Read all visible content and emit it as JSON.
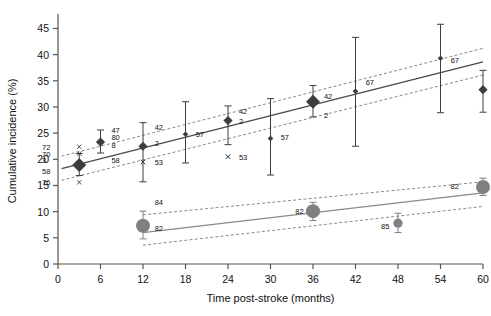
{
  "chart_data": {
    "type": "scatter",
    "title": "",
    "xlabel": "Time post-stroke (months)",
    "ylabel": "Cumulative incidence (%)",
    "xlim": [
      0,
      60
    ],
    "ylim": [
      0,
      47
    ],
    "xticks": [
      0,
      6,
      12,
      18,
      24,
      30,
      36,
      42,
      48,
      54,
      60
    ],
    "xtick_labels": [
      "0",
      "6",
      "12",
      "18",
      "24",
      "30",
      "36",
      "42",
      "48",
      "54",
      "60"
    ],
    "yticks": [
      0,
      5,
      10,
      15,
      20,
      25,
      30,
      35,
      40,
      45
    ],
    "ytick_labels": [
      "0",
      "5",
      "10",
      "15",
      "20",
      "25",
      "30",
      "35",
      "40",
      "45"
    ],
    "grid": false,
    "legend": "none",
    "colors": {
      "upper_marker": "#3d3d3d",
      "lower_marker": "#808080",
      "upper_line": "#4a4a4a",
      "lower_line": "#8a8a8a",
      "ci_band": "#8a8a8a",
      "axis": "#555555"
    },
    "series": [
      {
        "name": "upper-series",
        "marker": "diamond",
        "fit_line": {
          "x": [
            0.5,
            60
          ],
          "y": [
            18.2,
            38.6
          ]
        },
        "ci_upper": {
          "x": [
            0.5,
            60
          ],
          "y": [
            20.6,
            41.2
          ]
        },
        "ci_lower": {
          "x": [
            0.5,
            60
          ],
          "y": [
            16.0,
            36.1
          ]
        },
        "points": [
          {
            "x": 3,
            "y": 18.9,
            "lo": 16.9,
            "hi": 21.1,
            "size": "large",
            "labels": [
              "72",
              "70",
              "3",
              "58",
              "76"
            ]
          },
          {
            "x": 6,
            "y": 23.3,
            "lo": 21.2,
            "hi": 25.6,
            "size": "medium",
            "labels": [
              "47",
              "80",
              "8",
              "58"
            ]
          },
          {
            "x": 12,
            "y": 22.5,
            "lo": 15.7,
            "hi": 27.0,
            "size": "medium",
            "labels": [
              "42",
              "2",
              "53"
            ]
          },
          {
            "x": 18,
            "y": 24.8,
            "lo": 19.3,
            "hi": 31.0,
            "size": "small",
            "labels": [
              "57"
            ]
          },
          {
            "x": 24,
            "y": 27.4,
            "lo": 22.8,
            "hi": 30.2,
            "size": "medium",
            "labels": [
              "42",
              "2",
              "53"
            ]
          },
          {
            "x": 30,
            "y": 24.0,
            "lo": 17.0,
            "hi": 31.6,
            "size": "small",
            "labels": [
              "57"
            ]
          },
          {
            "x": 36,
            "y": 31.0,
            "lo": 28.1,
            "hi": 34.1,
            "size": "large",
            "labels": [
              "42",
              "2"
            ]
          },
          {
            "x": 42,
            "y": 33.0,
            "lo": 22.5,
            "hi": 43.3,
            "size": "small",
            "labels": [
              "67"
            ]
          },
          {
            "x": 54,
            "y": 39.3,
            "lo": 28.9,
            "hi": 45.8,
            "size": "small",
            "labels": [
              "67"
            ]
          },
          {
            "x": 60,
            "y": 33.3,
            "lo": 29.0,
            "hi": 37.0,
            "size": "medium",
            "labels": [
              "42"
            ]
          }
        ],
        "extra_markers": [
          {
            "x": 12,
            "y": 19.5,
            "label": "53"
          },
          {
            "x": 24,
            "y": 20.5,
            "label": "53"
          }
        ]
      },
      {
        "name": "lower-series",
        "marker": "circle",
        "fit_line": {
          "x": [
            12,
            60
          ],
          "y": [
            6.0,
            13.6
          ]
        },
        "ci_upper": {
          "x": [
            12,
            60
          ],
          "y": [
            9.4,
            15.7
          ]
        },
        "ci_lower": {
          "x": [
            12,
            60
          ],
          "y": [
            3.6,
            11.0
          ]
        },
        "points": [
          {
            "x": 12,
            "y": 7.3,
            "lo": 4.8,
            "hi": 10.1,
            "size": "large",
            "labels": [
              "84",
              "82"
            ]
          },
          {
            "x": 36,
            "y": 10.1,
            "lo": 8.3,
            "hi": 11.8,
            "size": "large",
            "labels": [
              "82"
            ]
          },
          {
            "x": 48,
            "y": 7.8,
            "lo": 6.0,
            "hi": 9.7,
            "size": "medium",
            "labels": [
              "85"
            ]
          },
          {
            "x": 60,
            "y": 14.7,
            "lo": 13.1,
            "hi": 16.4,
            "size": "large",
            "labels": [
              "82"
            ]
          }
        ]
      }
    ],
    "annotations": [
      {
        "text": "72",
        "x": 0.6,
        "y": 22.4
      },
      {
        "text": "70",
        "x": 0.6,
        "y": 21.1
      },
      {
        "text": "3",
        "x": 0.6,
        "y": 19.8
      },
      {
        "text": "58",
        "x": 0.6,
        "y": 17.8
      },
      {
        "text": "76",
        "x": 0.6,
        "y": 15.6
      },
      {
        "text": "47",
        "x": 7.4,
        "y": 25.6
      },
      {
        "text": "80",
        "x": 7.4,
        "y": 24.3
      },
      {
        "text": "8",
        "x": 7.4,
        "y": 22.7
      },
      {
        "text": "58",
        "x": 7.4,
        "y": 19.9
      },
      {
        "text": "42",
        "x": 13.5,
        "y": 26.2
      },
      {
        "text": "2",
        "x": 13.5,
        "y": 23.1
      },
      {
        "text": "53",
        "x": 13.5,
        "y": 19.5
      },
      {
        "text": "57",
        "x": 19.3,
        "y": 24.8
      },
      {
        "text": "42",
        "x": 25.4,
        "y": 29.3
      },
      {
        "text": "2",
        "x": 25.4,
        "y": 27.4
      },
      {
        "text": "53",
        "x": 25.4,
        "y": 20.5
      },
      {
        "text": "57",
        "x": 31.3,
        "y": 24.3
      },
      {
        "text": "42",
        "x": 37.4,
        "y": 32.1
      },
      {
        "text": "2",
        "x": 37.4,
        "y": 28.4
      },
      {
        "text": "67",
        "x": 43.3,
        "y": 34.8
      },
      {
        "text": "67",
        "x": 55.3,
        "y": 39.0
      },
      {
        "text": "42",
        "x": 61.0,
        "y": 32.8
      },
      {
        "text": "84",
        "x": 13.5,
        "y": 11.8
      },
      {
        "text": "82",
        "x": 13.5,
        "y": 6.8
      },
      {
        "text": "82",
        "x": 33.5,
        "y": 10.1
      },
      {
        "text": "85",
        "x": 45.6,
        "y": 7.3
      },
      {
        "text": "82",
        "x": 56.6,
        "y": 14.9
      }
    ]
  },
  "axes": {
    "xlabel": "Time post-stroke (months)",
    "ylabel": "Cumulative incidence (%)"
  }
}
